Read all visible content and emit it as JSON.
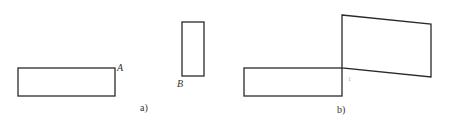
{
  "figure": {
    "panel_a": {
      "caption": "a)",
      "rect_a": {
        "x": 18,
        "y": 68,
        "w": 97,
        "h": 28,
        "label": "A"
      },
      "rect_b": {
        "x": 182,
        "y": 22,
        "w": 22,
        "h": 54,
        "label": "B"
      }
    },
    "panel_b": {
      "caption": "b)",
      "rect": {
        "x": 244,
        "y": 68,
        "w": 98,
        "h": 28
      },
      "quad_points": "342,15 431,24 431,77 342,68",
      "mark": "1"
    },
    "stroke_color": "#2a2a2a",
    "background": "#ffffff"
  }
}
